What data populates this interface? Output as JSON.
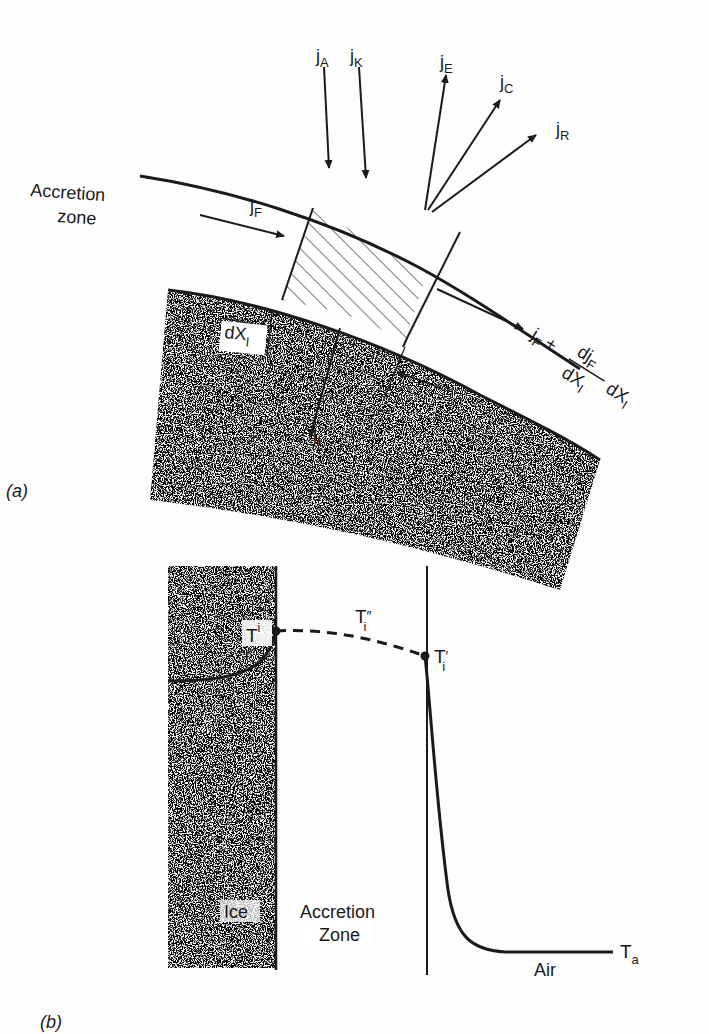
{
  "panel_a": {
    "caption": "(a)",
    "region_label_line1": "Accretion",
    "region_label_line2": "zone",
    "fluxes": {
      "jA": {
        "base": "j",
        "sub": "A"
      },
      "jK": {
        "base": "j",
        "sub": "K"
      },
      "jE": {
        "base": "j",
        "sub": "E"
      },
      "jC": {
        "base": "j",
        "sub": "C"
      },
      "jR": {
        "base": "j",
        "sub": "R"
      },
      "jF": {
        "base": "j",
        "sub": "F"
      },
      "jI": {
        "base": "j",
        "sub": "I"
      }
    },
    "dx_label": {
      "base": "dX",
      "sub": "I"
    },
    "outflow_label": {
      "term1_base": "j",
      "term1_sub": "F",
      "plus": "+",
      "num_base": "dj",
      "num_sub": "F",
      "den_base": "dX",
      "den_sub": "I",
      "tail_base": "dX",
      "tail_sub": "I"
    }
  },
  "panel_b": {
    "caption": "(b)",
    "labels": {
      "T_surface": {
        "base": "T",
        "sup": "i"
      },
      "T_double_prime": {
        "base": "T",
        "sub": "i",
        "mark": "″"
      },
      "T_prime": {
        "base": "T",
        "sub": "i",
        "mark": "′"
      },
      "T_air": {
        "base": "T",
        "sub": "a"
      }
    },
    "region_ice": "Ice",
    "region_accretion_line1": "Accretion",
    "region_accretion_line2": "Zone",
    "region_air": "Air"
  },
  "colors": {
    "ink": "#1a1a1a",
    "background": "#fdfdfd"
  }
}
